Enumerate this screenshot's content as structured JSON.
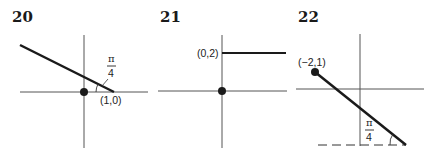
{
  "figures": [
    {
      "number": "20",
      "point_label": "(1,0)",
      "angle_label": {
        "numerator": "π",
        "denominator": "4"
      },
      "description": "Line through (1,0) making angle π/4 with the x-axis, extending up to the left; dot at origin"
    },
    {
      "number": "21",
      "point_label": "(0,2)",
      "description": "Horizontal ray starting at (0,2) extending to the right; dot at origin"
    },
    {
      "number": "22",
      "point_label": "(−2,1)",
      "angle_label": {
        "numerator": "π",
        "denominator": "4"
      },
      "description": "Segment from dot at (−2,1) going down-right, making angle π/4 with a dashed horizontal line below"
    }
  ],
  "colors": {
    "ink": "#1a1a1a",
    "axis": "#555555",
    "background": "#ffffff"
  }
}
